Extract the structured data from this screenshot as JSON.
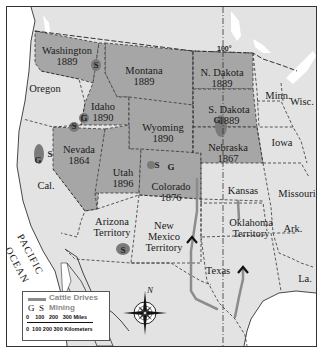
{
  "map": {
    "meridian_label": "100°",
    "ocean_label": [
      "PACIFIC",
      "OCEAN"
    ],
    "compass_label": "N",
    "colors": {
      "new_states": "#a6a6a6",
      "other_land": "#e3e3e3",
      "water": "#ffffff",
      "cattle_drive": "#8c8c8c",
      "mining_region": "#777777"
    },
    "states": [
      {
        "name": "Washington",
        "year": "1889",
        "highlighted": true
      },
      {
        "name": "Oregon",
        "year": "",
        "highlighted": false
      },
      {
        "name": "Montana",
        "year": "1889",
        "highlighted": true
      },
      {
        "name": "Idaho",
        "year": "1890",
        "highlighted": true
      },
      {
        "name": "N. Dakota",
        "year": "1889",
        "highlighted": true
      },
      {
        "name": "Minn.",
        "year": "",
        "highlighted": false
      },
      {
        "name": "Wisc.",
        "year": "",
        "highlighted": false
      },
      {
        "name": "S. Dakota",
        "year": "1889",
        "highlighted": true
      },
      {
        "name": "Wyoming",
        "year": "1890",
        "highlighted": true
      },
      {
        "name": "Iowa",
        "year": "",
        "highlighted": false
      },
      {
        "name": "Nevada",
        "year": "1864",
        "highlighted": true
      },
      {
        "name": "Nebraska",
        "year": "1867",
        "highlighted": true
      },
      {
        "name": "Utah",
        "year": "1896",
        "highlighted": true
      },
      {
        "name": "Cal.",
        "year": "",
        "highlighted": false
      },
      {
        "name": "Colorado",
        "year": "1876",
        "highlighted": true
      },
      {
        "name": "Kansas",
        "year": "",
        "highlighted": false
      },
      {
        "name": "Missouri",
        "year": "",
        "highlighted": false
      },
      {
        "name": "Arizona",
        "year": "Territory",
        "highlighted": false
      },
      {
        "name": "New",
        "year": "Mexico",
        "extra": "Territory",
        "highlighted": false
      },
      {
        "name": "Oklahoma",
        "year": "Territory",
        "highlighted": false
      },
      {
        "name": "Ark.",
        "year": "",
        "highlighted": false
      },
      {
        "name": "Texas",
        "year": "",
        "highlighted": false
      },
      {
        "name": "La.",
        "year": "",
        "highlighted": false
      }
    ],
    "mining_sites": [
      {
        "type": "S",
        "location": "Idaho/Washington border"
      },
      {
        "type": "G",
        "location": "Idaho"
      },
      {
        "type": "G",
        "location": "S. Dakota Black Hills"
      },
      {
        "type": "S",
        "location": "Nevada north"
      },
      {
        "type": "S",
        "location": "Nevada west"
      },
      {
        "type": "G",
        "location": "California"
      },
      {
        "type": "S",
        "location": "Colorado"
      },
      {
        "type": "G",
        "location": "Colorado"
      },
      {
        "type": "S",
        "location": "Arizona south"
      }
    ]
  },
  "legend": {
    "cattle_drives": "Cattle Drives",
    "mining_symbols": "G  S",
    "mining": "Mining",
    "miles_scale": "0    100   200   300 Miles",
    "km_scale": "0  100 200 300 Kilometers"
  }
}
